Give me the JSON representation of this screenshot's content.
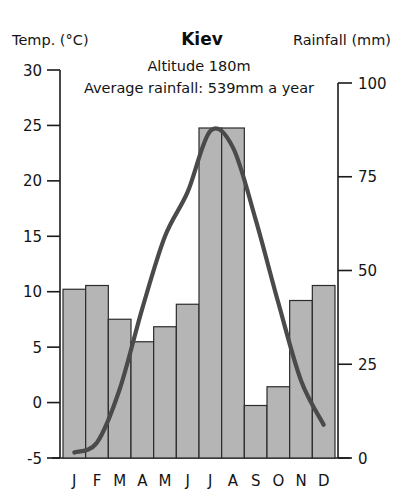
{
  "header": {
    "left_axis_title": "Temp. (°C)",
    "chart_title": "Kiev",
    "right_axis_title": "Rainfall (mm)",
    "subtitle_line1": "Altitude 180m",
    "subtitle_line2": "Average rainfall: 539mm a year"
  },
  "colors": {
    "bar_fill": "#b5b5b5",
    "bar_stroke": "#2b2b2b",
    "curve": "#4a4a4a",
    "axis": "#1a1a1a",
    "text": "#141414",
    "background": "#ffffff"
  },
  "chart_data": {
    "type": "bar",
    "title": "Kiev",
    "subtitle": "Altitude 180m / Average rainfall: 539mm a year",
    "xlabel": "",
    "ylabel": "Temp. (°C)",
    "y2label": "Rainfall (mm)",
    "grid": false,
    "legend_position": "none",
    "categories": [
      "J",
      "F",
      "M",
      "A",
      "M",
      "J",
      "J",
      "A",
      "S",
      "O",
      "N",
      "D"
    ],
    "months_full": [
      "January",
      "February",
      "March",
      "April",
      "May",
      "June",
      "July",
      "August",
      "September",
      "October",
      "November",
      "December"
    ],
    "ylim": [
      -5,
      30
    ],
    "yticks": [
      -5,
      0,
      5,
      10,
      15,
      20,
      25,
      30
    ],
    "ytick_labels": [
      "-5",
      "0",
      "5",
      "10",
      "15",
      "20",
      "25",
      "30"
    ],
    "y2lim": [
      0,
      100
    ],
    "y2ticks": [
      0,
      25,
      50,
      75,
      100
    ],
    "y2tick_labels": [
      "0",
      "25",
      "50",
      "75",
      "100"
    ],
    "series": [
      {
        "name": "Rainfall (mm)",
        "type": "bar",
        "axis": "right",
        "values": [
          45,
          46,
          37,
          31,
          35,
          41,
          88,
          88,
          14,
          19,
          42,
          46
        ]
      },
      {
        "name": "Temperature (°C)",
        "type": "line",
        "axis": "left",
        "values": [
          -4.5,
          -3.6,
          1.2,
          8.5,
          15.0,
          19.0,
          24.5,
          23.0,
          16.5,
          9.0,
          2.0,
          -2.0
        ]
      }
    ]
  }
}
